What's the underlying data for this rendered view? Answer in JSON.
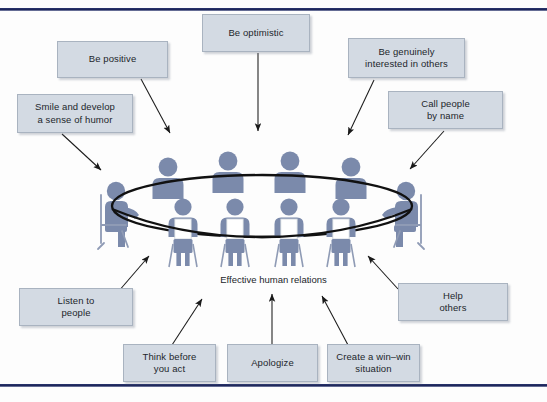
{
  "figure": {
    "caption": "Effective human relations",
    "colors": {
      "box_fill": "#d3dae3",
      "box_border": "#a9b3c0",
      "figure_blue": "#7b8aab",
      "figure_blue_dark": "#6b7a9c",
      "arrow": "#1a1a1a",
      "rule_navy": "#1d2558",
      "text": "#22262b"
    },
    "rules": {
      "top": "horizontal-navy-rule",
      "bottom": "horizontal-navy-rule"
    },
    "boxes": [
      {
        "id": "be-positive",
        "label": "Be positive",
        "lines": [
          "Be positive"
        ]
      },
      {
        "id": "be-optimistic",
        "label": "Be optimistic",
        "lines": [
          "Be optimistic"
        ]
      },
      {
        "id": "be-genuinely-interested",
        "label": "Be genuinely interested in others",
        "lines": [
          "Be genuinely",
          "interested in others"
        ]
      },
      {
        "id": "smile-and-develop",
        "label": "Smile and develop a sense of humor",
        "lines": [
          "Smile and develop",
          "a sense of humor"
        ]
      },
      {
        "id": "call-people-by-name",
        "label": "Call people by name",
        "lines": [
          "Call people",
          "by name"
        ]
      },
      {
        "id": "listen-to-people",
        "label": "Listen to people",
        "lines": [
          "Listen to",
          "people"
        ]
      },
      {
        "id": "think-before-you-act",
        "label": "Think before you act",
        "lines": [
          "Think before",
          "you act"
        ]
      },
      {
        "id": "apologize",
        "label": "Apologize",
        "lines": [
          "Apologize"
        ]
      },
      {
        "id": "create-win-win",
        "label": "Create a win–win situation",
        "lines": [
          "Create a win–win",
          "situation"
        ]
      },
      {
        "id": "help-others",
        "label": "Help others",
        "lines": [
          "Help",
          "others"
        ]
      }
    ],
    "illustration": {
      "name": "people-around-oval-conference-table",
      "table_shape": "oval",
      "back_row_people": 4,
      "front_row_people": 4,
      "side_people": 2,
      "total_people": 10
    },
    "arrows": {
      "count": 10,
      "direction": "from-label-box-to-table",
      "style": "thin-line-with-solid-arrowhead"
    }
  }
}
